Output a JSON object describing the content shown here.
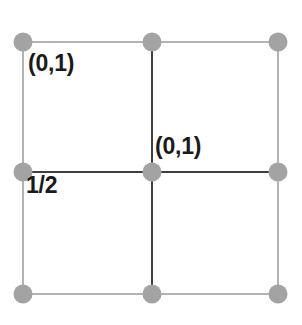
{
  "figure": {
    "background_color": "#ffffff",
    "width": 302,
    "height": 325
  },
  "style": {
    "outer_line_color": "#b3b3b3",
    "inner_line_color": "#3f3f3f",
    "node_color": "#a3a3a3",
    "label_color": "#1a1a1a",
    "outer_line_width": 2,
    "inner_line_width": 2,
    "node_radius": 9.5
  },
  "grid": {
    "left": 23,
    "right": 278,
    "top": 42,
    "bottom": 294,
    "center_x": 152,
    "center_y": 172,
    "columns": 2,
    "rows": 2
  },
  "nodes": [
    {
      "name": "node-top-left",
      "x": 23,
      "y": 42
    },
    {
      "name": "node-top-center",
      "x": 152,
      "y": 42
    },
    {
      "name": "node-top-right",
      "x": 278,
      "y": 42
    },
    {
      "name": "node-middle-left",
      "x": 23,
      "y": 172
    },
    {
      "name": "node-center",
      "x": 152,
      "y": 172
    },
    {
      "name": "node-middle-right",
      "x": 278,
      "y": 172
    },
    {
      "name": "node-bottom-left",
      "x": 23,
      "y": 294
    },
    {
      "name": "node-bottom-center",
      "x": 152,
      "y": 294
    },
    {
      "name": "node-bottom-right",
      "x": 278,
      "y": 294
    }
  ],
  "labels": {
    "top_left": "(0,1)",
    "center": "(0,1)",
    "lower_left": "1/2"
  },
  "chart_data": {
    "type": "diagram",
    "title": "",
    "annotations": [
      {
        "text": "(0,1)",
        "x": 28,
        "y": 52,
        "anchor": "top-left-cell"
      },
      {
        "text": "(0,1)",
        "x": 155,
        "y": 135,
        "anchor": "center-vertex"
      },
      {
        "text": "1/2",
        "x": 26,
        "y": 174,
        "anchor": "middle-left-edge"
      }
    ],
    "vertices_x": [
      23,
      152,
      278
    ],
    "vertices_y": [
      42,
      172,
      294
    ],
    "grid": true,
    "legend": "none"
  }
}
